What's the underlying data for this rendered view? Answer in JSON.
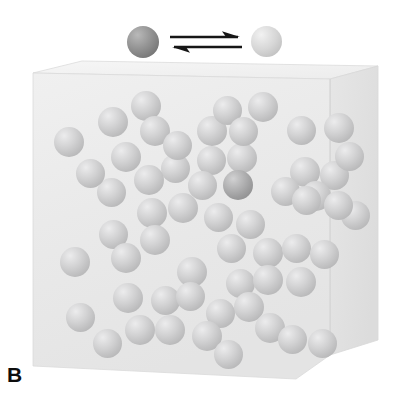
{
  "figure": {
    "panel_label": "B",
    "width": 408,
    "height": 409,
    "background_color": "#ffffff"
  },
  "legend": {
    "reactant": {
      "icon": "dark-gray-sphere",
      "color": "#8c8c8c",
      "x": 143,
      "y": 42,
      "radius": 16
    },
    "product": {
      "icon": "light-gray-sphere",
      "color": "#d8d8d8",
      "x": 266,
      "y": 42,
      "radius": 15.5
    },
    "equilibrium": {
      "icon": "equilibrium-double-arrow",
      "color": "#161616",
      "top_arrow_direction": "right",
      "bottom_arrow_direction": "left",
      "x": 170,
      "y": 28,
      "width": 72,
      "height": 30
    }
  },
  "container": {
    "name": "gas-container-box",
    "style": "3d-perspective-cube",
    "face_color": "#ebebeb",
    "top_face_color": "#f4f4f4",
    "right_face_color": "#e2e2e2",
    "edge_color": "#d2d2d2",
    "front_face": [
      [
        33,
        73
      ],
      [
        330,
        79
      ],
      [
        330,
        355
      ],
      [
        296,
        379
      ],
      [
        33,
        366
      ]
    ],
    "top_face": [
      [
        33,
        73
      ],
      [
        82,
        61
      ],
      [
        378,
        66
      ],
      [
        330,
        79
      ]
    ],
    "right_face": [
      [
        330,
        79
      ],
      [
        378,
        66
      ],
      [
        378,
        340
      ],
      [
        330,
        355
      ]
    ]
  },
  "particles": {
    "count": 58,
    "radius": 14.5,
    "dark_count": 1,
    "light_color": "#cacaca",
    "dark_color": "#a4a4a4",
    "items": [
      {
        "x": 69,
        "y": 142,
        "r": 15,
        "dark": false
      },
      {
        "x": 113,
        "y": 122,
        "r": 15,
        "dark": false
      },
      {
        "x": 146,
        "y": 106,
        "r": 15,
        "dark": false
      },
      {
        "x": 155,
        "y": 131,
        "r": 15,
        "dark": false
      },
      {
        "x": 212,
        "y": 131,
        "r": 15,
        "dark": false
      },
      {
        "x": 227,
        "y": 110,
        "r": 14.5,
        "dark": false
      },
      {
        "x": 263,
        "y": 107,
        "r": 15,
        "dark": false
      },
      {
        "x": 301,
        "y": 130,
        "r": 14.5,
        "dark": false
      },
      {
        "x": 339,
        "y": 128,
        "r": 15,
        "dark": false
      },
      {
        "x": 126,
        "y": 157,
        "r": 15,
        "dark": false
      },
      {
        "x": 175,
        "y": 168,
        "r": 14.5,
        "dark": false
      },
      {
        "x": 211,
        "y": 160,
        "r": 14.5,
        "dark": false
      },
      {
        "x": 242,
        "y": 158,
        "r": 15,
        "dark": false
      },
      {
        "x": 149,
        "y": 180,
        "r": 15,
        "dark": false
      },
      {
        "x": 305,
        "y": 172,
        "r": 15,
        "dark": false
      },
      {
        "x": 334,
        "y": 175,
        "r": 14.5,
        "dark": false
      },
      {
        "x": 111,
        "y": 192,
        "r": 14.5,
        "dark": false
      },
      {
        "x": 238,
        "y": 185,
        "r": 15,
        "dark": true
      },
      {
        "x": 285,
        "y": 191,
        "r": 14.5,
        "dark": false
      },
      {
        "x": 316,
        "y": 196,
        "r": 15,
        "dark": false
      },
      {
        "x": 152,
        "y": 213,
        "r": 15,
        "dark": false
      },
      {
        "x": 183,
        "y": 208,
        "r": 15,
        "dark": false
      },
      {
        "x": 218,
        "y": 217,
        "r": 14.5,
        "dark": false
      },
      {
        "x": 250,
        "y": 224,
        "r": 14.5,
        "dark": false
      },
      {
        "x": 355,
        "y": 215,
        "r": 14.5,
        "dark": false
      },
      {
        "x": 113,
        "y": 234,
        "r": 14.5,
        "dark": false
      },
      {
        "x": 155,
        "y": 240,
        "r": 15,
        "dark": false
      },
      {
        "x": 75,
        "y": 262,
        "r": 15,
        "dark": false
      },
      {
        "x": 126,
        "y": 258,
        "r": 15,
        "dark": false
      },
      {
        "x": 231,
        "y": 248,
        "r": 14.5,
        "dark": false
      },
      {
        "x": 268,
        "y": 253,
        "r": 15,
        "dark": false
      },
      {
        "x": 296,
        "y": 248,
        "r": 14.5,
        "dark": false
      },
      {
        "x": 324,
        "y": 254,
        "r": 14.5,
        "dark": false
      },
      {
        "x": 192,
        "y": 272,
        "r": 15,
        "dark": false
      },
      {
        "x": 240,
        "y": 283,
        "r": 14.5,
        "dark": false
      },
      {
        "x": 268,
        "y": 280,
        "r": 15,
        "dark": false
      },
      {
        "x": 301,
        "y": 282,
        "r": 15,
        "dark": false
      },
      {
        "x": 128,
        "y": 298,
        "r": 15,
        "dark": false
      },
      {
        "x": 165,
        "y": 300,
        "r": 14.5,
        "dark": false
      },
      {
        "x": 190,
        "y": 296,
        "r": 14.5,
        "dark": false
      },
      {
        "x": 249,
        "y": 307,
        "r": 15,
        "dark": false
      },
      {
        "x": 220,
        "y": 313,
        "r": 14.5,
        "dark": false
      },
      {
        "x": 80,
        "y": 317,
        "r": 14.5,
        "dark": false
      },
      {
        "x": 140,
        "y": 330,
        "r": 15,
        "dark": false
      },
      {
        "x": 170,
        "y": 330,
        "r": 15,
        "dark": false
      },
      {
        "x": 207,
        "y": 336,
        "r": 15,
        "dark": false
      },
      {
        "x": 107,
        "y": 343,
        "r": 14.5,
        "dark": false
      },
      {
        "x": 270,
        "y": 328,
        "r": 15,
        "dark": false
      },
      {
        "x": 292,
        "y": 339,
        "r": 14.5,
        "dark": false
      },
      {
        "x": 322,
        "y": 343,
        "r": 14.5,
        "dark": false
      },
      {
        "x": 306,
        "y": 200,
        "r": 14.5,
        "dark": false
      },
      {
        "x": 338,
        "y": 205,
        "r": 14.5,
        "dark": false
      },
      {
        "x": 202,
        "y": 185,
        "r": 14.5,
        "dark": false
      },
      {
        "x": 177,
        "y": 145,
        "r": 14.5,
        "dark": false
      },
      {
        "x": 90,
        "y": 173,
        "r": 14.5,
        "dark": false
      },
      {
        "x": 243,
        "y": 131,
        "r": 14.5,
        "dark": false
      },
      {
        "x": 349,
        "y": 156,
        "r": 14.5,
        "dark": false
      },
      {
        "x": 228,
        "y": 354,
        "r": 14.5,
        "dark": false
      }
    ]
  }
}
